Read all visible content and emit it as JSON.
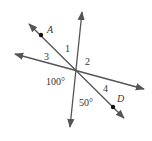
{
  "diagram": {
    "type": "intersecting-lines-angles",
    "points": [
      {
        "name": "A",
        "x": 41,
        "y": 35
      },
      {
        "name": "D",
        "x": 113,
        "y": 107
      }
    ],
    "angle_labels": [
      {
        "id": "angle-1",
        "text": "1"
      },
      {
        "id": "angle-2",
        "text": "2"
      },
      {
        "id": "angle-3",
        "text": "3"
      },
      {
        "id": "angle-4",
        "text": "4"
      },
      {
        "id": "angle-100",
        "text": "100°"
      },
      {
        "id": "angle-50",
        "text": "50°"
      }
    ],
    "point_labels": {
      "A": "A",
      "D": "D"
    },
    "colors": {
      "line": "#555555",
      "text": "#333333",
      "point": "#111111"
    }
  }
}
